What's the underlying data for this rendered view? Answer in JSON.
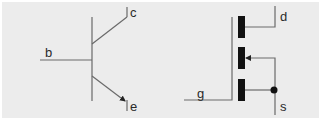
{
  "diagram": {
    "bjt": {
      "name": "Bipolar junction transistor (NPN)",
      "terminals": {
        "base": "b",
        "collector": "c",
        "emitter": "e"
      }
    },
    "mosfet": {
      "name": "Enhancement MOSFET (n-channel)",
      "terminals": {
        "gate": "g",
        "drain": "d",
        "source": "s"
      }
    },
    "colors": {
      "background": "#ececec",
      "wire": "#6a6a6a",
      "channel": "#111111",
      "label": "#2a2a2a"
    }
  }
}
